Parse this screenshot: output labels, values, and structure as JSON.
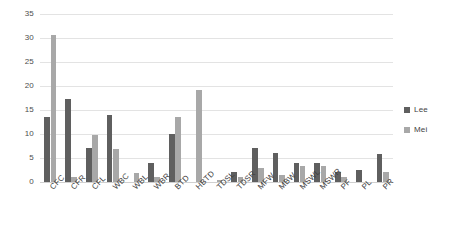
{
  "chart_data": {
    "type": "bar",
    "title": "",
    "subtitle": "",
    "xlabel": "",
    "ylabel": "",
    "ylim": [
      0,
      35
    ],
    "yticks": [
      0,
      5,
      10,
      15,
      20,
      25,
      30,
      35
    ],
    "ytick_labels": [
      "0",
      "5",
      "10",
      "15",
      "20",
      "25",
      "30",
      "35"
    ],
    "grid": true,
    "grid_axis": "y",
    "legend_position": "right",
    "categories": [
      "CFC",
      "CFR",
      "CFL",
      "WBC",
      "WBL",
      "WBR",
      "BTD",
      "HBTD",
      "TDSL",
      "TDSR",
      "MFW",
      "MBW",
      "MSWL",
      "MSWR",
      "PF",
      "PL",
      "PR"
    ],
    "series": [
      {
        "name": "Lee",
        "color": "#5f5f5f",
        "values": [
          13.5,
          17.3,
          7.1,
          14.0,
          0,
          4.0,
          10.1,
          0,
          0,
          2.0,
          7.0,
          6.1,
          4.0,
          4.0,
          2.0,
          2.4,
          5.9
        ]
      },
      {
        "name": "Mei",
        "color": "#a8a8a8",
        "values": [
          30.7,
          1.1,
          9.7,
          6.9,
          1.9,
          1.0,
          13.5,
          19.2,
          0.4,
          1.0,
          3.0,
          1.4,
          3.4,
          3.4,
          1.0,
          0,
          2.0
        ]
      }
    ]
  },
  "legend": {
    "items": [
      {
        "label": "Lee",
        "color": "#5f5f5f",
        "marker": "square-marker"
      },
      {
        "label": "Mei",
        "color": "#a8a8a8",
        "marker": "square-marker"
      }
    ]
  },
  "colors": {
    "background": "#ffffff",
    "gridline": "#e3e3e3",
    "axis_text": "#4d4d4d",
    "series_lee": "#5f5f5f",
    "series_mei": "#a8a8a8"
  }
}
